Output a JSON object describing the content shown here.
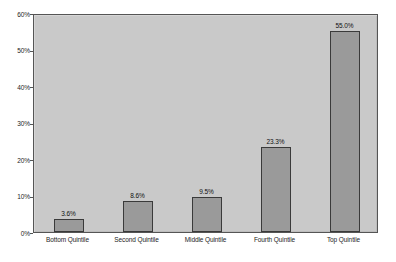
{
  "chart_data": {
    "type": "bar",
    "title": "",
    "subtitle": "",
    "xlabel": "",
    "ylabel": "",
    "categories": [
      "Bottom Quintile",
      "Second Quintile",
      "Middle Quintile",
      "Fourth Quintile",
      "Top Quintile"
    ],
    "values": [
      3.6,
      8.6,
      9.5,
      23.3,
      55.0
    ],
    "data_labels": [
      "3.6%",
      "8.6%",
      "9.5%",
      "23.3%",
      "55.0%"
    ],
    "ylim": [
      0,
      60
    ],
    "ytick_values": [
      0,
      10,
      20,
      30,
      40,
      50,
      60
    ],
    "ytick_labels": [
      "0%",
      "10%",
      "20%",
      "30%",
      "40%",
      "50%",
      "60%"
    ],
    "grid": false,
    "legend": null,
    "legend_position": "none",
    "annotations": [],
    "colors": {
      "bar_fill": "#9a9a9a",
      "bar_border": "#3a3a3a",
      "plot_background": "#c9c9c9",
      "plot_border": "#555555",
      "figure_background": "#ffffff",
      "text": "#1c1c1c"
    }
  }
}
